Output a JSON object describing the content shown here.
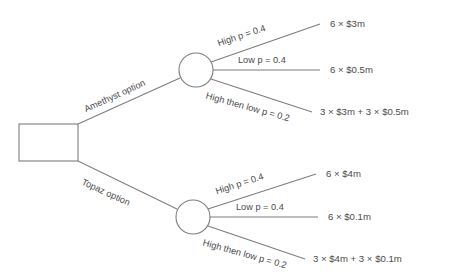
{
  "diagram": {
    "type": "decision-tree",
    "title": "",
    "decision_node": {
      "shape": "square",
      "label": ""
    },
    "branches": [
      {
        "id": "amethyst",
        "option_label": "Amethyst option",
        "chance_node": {
          "shape": "circle"
        },
        "outcomes": [
          {
            "id": "amethyst-high",
            "probability_label": "High p = 0.4",
            "payoff": "6 × $3m"
          },
          {
            "id": "amethyst-low",
            "probability_label": "Low p = 0.4",
            "payoff": "6 × $0.5m"
          },
          {
            "id": "amethyst-highlow",
            "probability_label": "High then low p = 0.2",
            "payoff": "3 × $3m + 3 × $0.5m"
          }
        ]
      },
      {
        "id": "topaz",
        "option_label": "Topaz option",
        "chance_node": {
          "shape": "circle"
        },
        "outcomes": [
          {
            "id": "topaz-high",
            "probability_label": "High p = 0.4",
            "payoff": "6 × $4m"
          },
          {
            "id": "topaz-low",
            "probability_label": "Low p = 0.4",
            "payoff": "6 × $0.1m"
          },
          {
            "id": "topaz-highlow",
            "probability_label": "High then low p = 0.2",
            "payoff": "3 × $4m + 3 × $0.1m"
          }
        ]
      }
    ],
    "colors": {
      "line": "#7d7d7d",
      "text": "#4a4a4a",
      "background": "#ffffff"
    }
  }
}
